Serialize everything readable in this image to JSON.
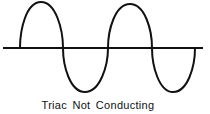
{
  "diagram": {
    "caption": "Triac Not Conducting",
    "waveform": "sine",
    "cycles": 2,
    "stroke_color": "#111111",
    "axis_color": "#111111",
    "background": "#ffffff"
  }
}
